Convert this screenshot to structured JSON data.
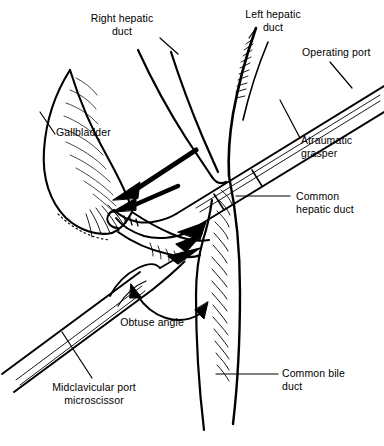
{
  "figure": {
    "width": 384,
    "height": 446,
    "background_color": "#ffffff",
    "ink_color": "#000000",
    "style": "black-and-white line drawing"
  },
  "labels": {
    "right_hepatic_duct": "Right hepatic\nduct",
    "left_hepatic_duct": "Left hepatic\nduct",
    "operating_port": "Operating port",
    "atraumatic_grasper": "Atraumatic\ngrasper",
    "gallbladder": "Gallbladder",
    "common_hepatic_duct": "Common\nhepatic duct",
    "common_bile_duct": "Common bile\nduct",
    "obtuse_angle": "Obtuse angle",
    "midclavicular_port_microscissor": "Midclavicular port\nmicroscissor"
  },
  "annotations": {
    "retraction_arrow": "retraction-arrow",
    "angle_arc_arrow": "double-headed-arc-arrow"
  },
  "anatomy": [
    "gallbladder",
    "right-hepatic-duct",
    "left-hepatic-duct",
    "common-hepatic-duct",
    "common-bile-duct",
    "cystic-duct"
  ],
  "instruments": [
    "atraumatic-grasper",
    "microscissor"
  ]
}
